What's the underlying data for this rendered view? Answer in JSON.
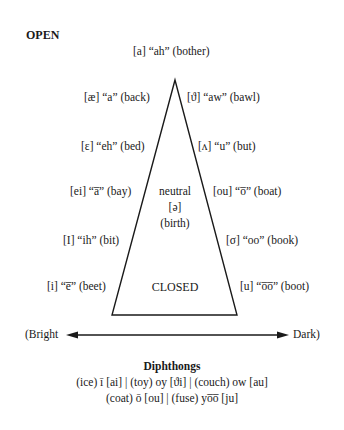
{
  "title_open": "OPEN",
  "top_vowel": "[a] “ah” (bother)",
  "left_vowels": [
    "[æ] “a” (back)",
    "[ɛ] “eh” (bed)",
    "[ei] “a̅” (bay)",
    "[I] “ih” (bit)",
    "[i] “e̅” (beet)"
  ],
  "right_vowels": [
    "[ϑ] “aw” (bawl)",
    "[ʌ] “u” (but)",
    "[ou] “o̅” (boat)",
    "[σ] “oo” (book)",
    "[u] “o̅o̅” (boot)"
  ],
  "center": {
    "line1": "neutral",
    "line2": "[ə]",
    "line3": "(birth)",
    "closed": "CLOSED"
  },
  "axis": {
    "left_label": "(Bright",
    "right_label": "Dark)"
  },
  "diphthongs": {
    "heading": "Diphthongs",
    "line1": "(ice) ī [ai] | (toy) oy [ϑi] | (couch) ow [au]",
    "line2": "(coat) ō [ou] | (fuse) yo̅o̅ [ju]"
  }
}
